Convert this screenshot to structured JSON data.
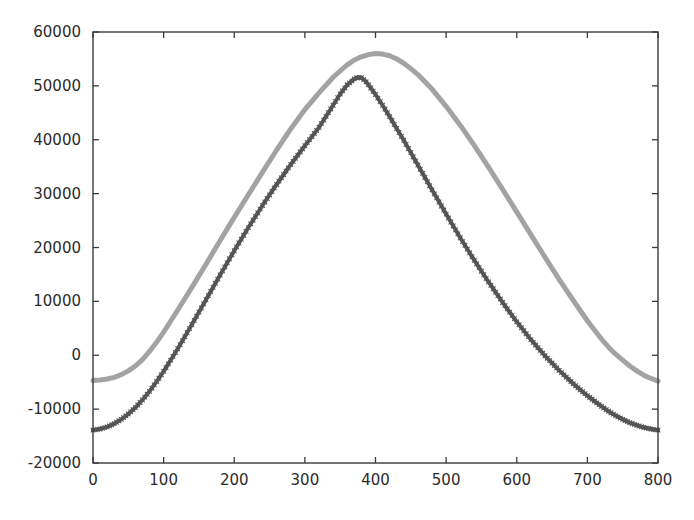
{
  "chart_data": {
    "type": "line",
    "title": "",
    "subtitle": "",
    "xlabel": "",
    "ylabel": "",
    "xlim": [
      0,
      800
    ],
    "ylim": [
      -20000,
      60000
    ],
    "xticks": [
      0,
      100,
      200,
      300,
      400,
      500,
      600,
      700,
      800
    ],
    "yticks": [
      -20000,
      -10000,
      0,
      10000,
      20000,
      30000,
      40000,
      50000,
      60000
    ],
    "xtick_labels": [
      "0",
      "100",
      "200",
      "300",
      "400",
      "500",
      "600",
      "700",
      "800"
    ],
    "ytick_labels": [
      "-20000",
      "-10000",
      "0",
      "10000",
      "20000",
      "30000",
      "40000",
      "50000",
      "60000"
    ],
    "grid": false,
    "legend": "none",
    "background_color": "#ffffff",
    "axis_color": "#3a3a3a",
    "series": [
      {
        "name": "upper-series",
        "color": "#a3a3a3",
        "linewidth": 5,
        "marker": "none",
        "x": [
          0,
          10,
          20,
          30,
          40,
          50,
          60,
          70,
          80,
          90,
          100,
          120,
          140,
          160,
          180,
          200,
          220,
          240,
          260,
          280,
          300,
          320,
          340,
          350,
          360,
          370,
          380,
          390,
          400,
          410,
          420,
          430,
          440,
          450,
          460,
          480,
          500,
          520,
          540,
          560,
          580,
          600,
          620,
          640,
          660,
          680,
          700,
          710,
          720,
          730,
          740,
          750,
          760,
          770,
          780,
          790,
          800
        ],
        "y": [
          -4700,
          -4600,
          -4400,
          -4100,
          -3600,
          -2900,
          -2000,
          -800,
          700,
          2400,
          4300,
          8400,
          12600,
          16900,
          21300,
          25600,
          29800,
          34000,
          38100,
          42000,
          45600,
          48700,
          51600,
          52800,
          53900,
          54800,
          55400,
          55800,
          56000,
          55900,
          55600,
          55000,
          54200,
          53200,
          52100,
          49400,
          46200,
          42700,
          38900,
          34900,
          30800,
          26600,
          22400,
          18200,
          14100,
          10200,
          6400,
          4700,
          3000,
          1500,
          200,
          -900,
          -2000,
          -2900,
          -3700,
          -4300,
          -4800
        ]
      },
      {
        "name": "lower-series",
        "color": "#555555",
        "linewidth": 4,
        "marker": "x",
        "x": [
          0,
          10,
          20,
          30,
          40,
          50,
          60,
          70,
          80,
          90,
          100,
          120,
          140,
          160,
          180,
          200,
          220,
          240,
          260,
          280,
          300,
          320,
          340,
          350,
          360,
          370,
          375,
          380,
          385,
          390,
          400,
          410,
          420,
          430,
          440,
          450,
          460,
          480,
          500,
          520,
          540,
          560,
          580,
          600,
          620,
          640,
          660,
          680,
          700,
          710,
          720,
          730,
          740,
          750,
          760,
          770,
          780,
          790,
          800
        ],
        "y": [
          -13900,
          -13700,
          -13300,
          -12700,
          -11900,
          -10900,
          -9700,
          -8300,
          -6700,
          -4900,
          -3000,
          1200,
          5700,
          10300,
          14900,
          19400,
          23700,
          27800,
          31700,
          35400,
          38900,
          42300,
          46400,
          48500,
          50200,
          51300,
          51600,
          51500,
          51000,
          50200,
          48400,
          46400,
          44300,
          42100,
          39900,
          37600,
          35300,
          30700,
          26200,
          21800,
          17600,
          13600,
          9800,
          6200,
          2900,
          -100,
          -2800,
          -5300,
          -7500,
          -8500,
          -9500,
          -10400,
          -11200,
          -11900,
          -12500,
          -13000,
          -13400,
          -13700,
          -13900
        ]
      }
    ]
  },
  "axes_geometry": {
    "plot_left": 93,
    "plot_top": 32,
    "plot_right": 658,
    "plot_bottom": 463
  }
}
